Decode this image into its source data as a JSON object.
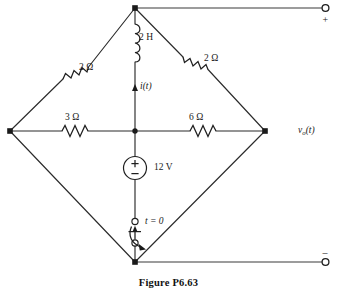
{
  "figure": {
    "caption": "Figure P6.63",
    "type": "circuit-schematic"
  },
  "components": {
    "inductor": {
      "label": "2 H",
      "name": "inductor-2h",
      "orientation": "vertical",
      "branch": "top-node-to-center-node"
    },
    "resistor_upper_left": {
      "label": "2 Ω",
      "name": "resistor-2ohm-upper-left",
      "orientation": "diagonal",
      "branch": "left-node-to-top-node"
    },
    "resistor_upper_right": {
      "label": "2 Ω",
      "name": "resistor-2ohm-upper-right",
      "orientation": "diagonal",
      "branch": "top-node-to-right-node"
    },
    "resistor_left": {
      "label": "3 Ω",
      "name": "resistor-3ohm",
      "orientation": "horizontal",
      "branch": "left-node-to-center-node"
    },
    "resistor_right": {
      "label": "6 Ω",
      "name": "resistor-6ohm",
      "orientation": "horizontal",
      "branch": "center-node-to-right-node"
    },
    "source": {
      "label": "12 V",
      "name": "voltage-source-12v",
      "plus": "+",
      "minus": "–",
      "orientation": "vertical",
      "branch": "center-node-to-switch"
    },
    "switch": {
      "label": "t = 0",
      "name": "switch-t0",
      "state": "open",
      "branch": "source-to-bottom-node"
    }
  },
  "annotations": {
    "current": {
      "label": "i(t)",
      "name": "current-i-of-t",
      "direction": "upward"
    },
    "output_voltage": {
      "label_main": "v",
      "label_sub": "o",
      "label_tail": "(t)",
      "label_full": "vₒ(t)",
      "name": "output-voltage-vo-of-t"
    },
    "terminal_plus": "+",
    "terminal_minus": "–"
  },
  "terminals": {
    "top": {
      "name": "output-terminal-positive",
      "polarity": "+"
    },
    "bottom": {
      "name": "output-terminal-negative",
      "polarity": "–"
    }
  },
  "colors": {
    "wire": "#2b2b2b",
    "component": "#1f1f1f",
    "text": "#1a1a1a",
    "background": "#ffffff"
  }
}
